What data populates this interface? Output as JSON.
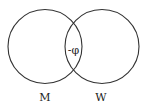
{
  "diagram": {
    "type": "venn",
    "sets": [
      {
        "label": "M"
      },
      {
        "label": "W"
      }
    ],
    "intersection_label": "-φ",
    "stroke_color": "#333333",
    "background": "#ffffff"
  }
}
